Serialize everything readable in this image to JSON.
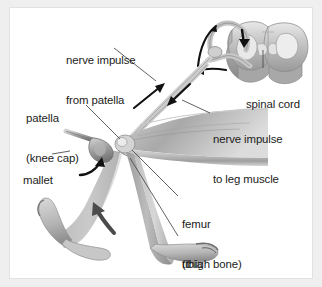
{
  "figure": {
    "style": "grayscale anatomical illustration",
    "background_color": "#efefef",
    "panel_color": "#ffffff",
    "border_color": "#e2e2e2",
    "text_color": "#1b1b1b"
  },
  "labels": {
    "nerve_impulse_from_patella": {
      "line1": "nerve impulse",
      "line2": "from patella"
    },
    "patella": {
      "line1": "patella",
      "line2": "(knee cap)"
    },
    "mallet": {
      "line1": "mallet"
    },
    "spinal_cord": {
      "line1": "spinal cord"
    },
    "nerve_impulse_to_leg_muscle": {
      "line1": "nerve impulse",
      "line2": "to leg muscle"
    },
    "femur": {
      "line1": "femur",
      "line2": "(thigh bone)"
    },
    "tibia": {
      "line1": "tibia",
      "line2": "(leg bone)"
    }
  },
  "parts": [
    {
      "name": "spinal-cord",
      "description": "cross-section of spinal cord with butterfly-shaped grey matter"
    },
    {
      "name": "sensory-nerve",
      "description": "afferent nerve running from patella up to spinal cord"
    },
    {
      "name": "motor-nerve",
      "description": "efferent nerve running from spinal cord down to leg muscle"
    },
    {
      "name": "thigh",
      "description": "upper leg with femur and quadriceps muscle"
    },
    {
      "name": "lower-leg",
      "description": "lower leg with tibia, shown kicking forward"
    },
    {
      "name": "mallet",
      "description": "reflex hammer striking the patellar tendon"
    }
  ],
  "arrows": [
    {
      "name": "impulse-up-arrow",
      "direction": "up-right",
      "meaning": "sensory impulse travelling to spinal cord"
    },
    {
      "name": "impulse-down-arrow",
      "direction": "down-left",
      "meaning": "motor impulse travelling to leg muscle"
    },
    {
      "name": "cord-entry-arrow",
      "direction": "up-right",
      "meaning": "impulse entering spinal cord"
    },
    {
      "name": "cord-inner-arrow",
      "direction": "down",
      "meaning": "signal relayed inside spinal cord"
    },
    {
      "name": "cord-exit-arrow",
      "direction": "left",
      "meaning": "impulse leaving spinal cord"
    },
    {
      "name": "mallet-strike-arrow",
      "direction": "curved-up",
      "meaning": "mallet tapping the knee"
    },
    {
      "name": "kick-arrow",
      "direction": "up-left",
      "meaning": "lower leg kicks forward"
    }
  ]
}
